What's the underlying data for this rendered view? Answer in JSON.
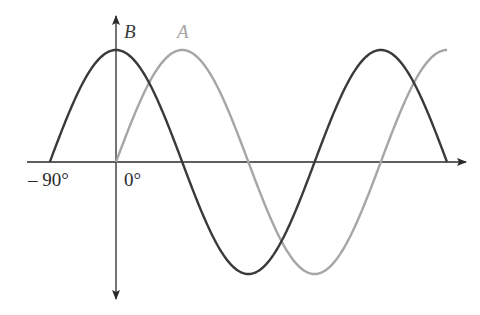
{
  "diagram": {
    "title": "",
    "colors": {
      "curve_a": "#a6a6a6",
      "curve_b": "#3a3a3a",
      "axis": "#2a2a2a",
      "background": "#ffffff"
    },
    "labels": {
      "curve_a": "A",
      "curve_b": "B",
      "tick_minus90": "– 90°",
      "tick_0": "0°"
    }
  },
  "chart_data": {
    "type": "line",
    "title": "",
    "xlabel": "phase angle",
    "ylabel": "",
    "x_ticks": [
      "-90°",
      "0°"
    ],
    "xlim_deg": [
      -90,
      450
    ],
    "ylim": [
      -1,
      1
    ],
    "grid": false,
    "series": [
      {
        "name": "A",
        "function": "sin(theta)",
        "x_deg": [
          0,
          90,
          180,
          270,
          360,
          450
        ],
        "values": [
          0,
          1,
          0,
          -1,
          0,
          1
        ]
      },
      {
        "name": "B",
        "function": "cos(theta)",
        "x_deg": [
          -90,
          0,
          90,
          180,
          270,
          360
        ],
        "values": [
          0,
          1,
          0,
          -1,
          0,
          1
        ]
      }
    ]
  }
}
